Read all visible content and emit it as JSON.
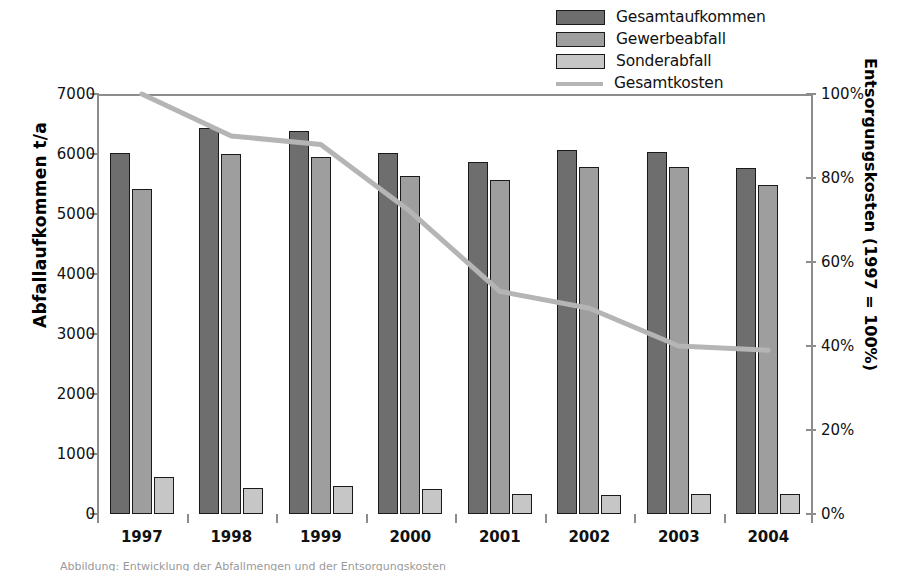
{
  "chart_data": {
    "type": "bar",
    "title": "",
    "categories": [
      "1997",
      "1998",
      "1999",
      "2000",
      "2001",
      "2002",
      "2003",
      "2004"
    ],
    "series": [
      {
        "name": "Gesamtaufkommen",
        "axis": "left",
        "color": "#6e6e6e",
        "values": [
          6020,
          6440,
          6380,
          6020,
          5860,
          6060,
          6040,
          5760
        ]
      },
      {
        "name": "Gewerbeabfall",
        "axis": "left",
        "color": "#9e9e9e",
        "values": [
          5420,
          6000,
          5950,
          5640,
          5560,
          5790,
          5780,
          5480
        ]
      },
      {
        "name": "Sonderabfall",
        "axis": "left",
        "color": "#c6c6c6",
        "values": [
          610,
          430,
          460,
          420,
          340,
          320,
          330,
          340
        ]
      },
      {
        "name": "Gesamtkosten",
        "axis": "right",
        "type": "line",
        "color": "#b5b5b5",
        "values": [
          100,
          90,
          88,
          72,
          53,
          49,
          40,
          39
        ]
      }
    ],
    "xlabel": "",
    "ylabel": "Abfallaufkommen t/a",
    "ylabel_right": "Entsorgungskosten (1997 = 100%)",
    "ylim": [
      0,
      7000
    ],
    "ylim_right": [
      0,
      100
    ],
    "yticks": [
      0,
      1000,
      2000,
      3000,
      4000,
      5000,
      6000,
      7000
    ],
    "ytick_labels": [
      "0",
      "1000",
      "2000",
      "3000",
      "4000",
      "5000",
      "6000",
      "7000"
    ],
    "yticks_right": [
      0,
      20,
      40,
      60,
      80,
      100
    ],
    "ytick_labels_right": [
      "0%",
      "20%",
      "40%",
      "60%",
      "80%",
      "100%"
    ],
    "grid": false,
    "legend_position": "top-right"
  },
  "legend": {
    "items": [
      {
        "label": "Gesamtaufkommen",
        "marker": "swatch",
        "color": "#6e6e6e"
      },
      {
        "label": "Gewerbeabfall",
        "marker": "swatch",
        "color": "#9e9e9e"
      },
      {
        "label": "Sonderabfall",
        "marker": "swatch",
        "color": "#c6c6c6"
      },
      {
        "label": "Gesamtkosten",
        "marker": "line",
        "color": "#b5b5b5"
      }
    ]
  },
  "caption": {
    "text": "Abbildung: Entwicklung der Abfallmengen und der Entsorgungskosten"
  }
}
